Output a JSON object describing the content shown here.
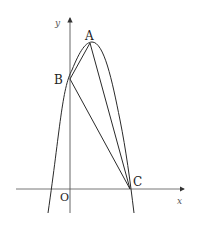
{
  "figure": {
    "axes": {
      "x_label": "x",
      "y_label": "y",
      "origin_label": "O"
    },
    "points": {
      "A": "A",
      "B": "B",
      "C": "C"
    },
    "colors": {
      "stroke": "#2a2a2a",
      "axis": "#555555"
    }
  }
}
